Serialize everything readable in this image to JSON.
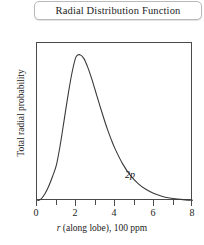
{
  "title": {
    "text": "Radial Distribution Function"
  },
  "annotation": {
    "orbital_label": "2p"
  },
  "axis": {
    "y_title": "Total radial probability",
    "x_title_italic": "r",
    "x_title_rest": " (along lobe), 100 ppm"
  },
  "colors": {
    "frame": "#4a4a4a",
    "curve": "#3a3a3a",
    "title_border": "#b9b9b9",
    "text": "#1b1b1b",
    "background": "#ffffff"
  },
  "chart_data": {
    "type": "line",
    "title": "Radial Distribution Function",
    "xlabel": "r (along lobe), 100 ppm",
    "ylabel": "Total radial probability",
    "xlim": [
      0,
      8
    ],
    "ylim": [
      0,
      1.08
    ],
    "grid": false,
    "legend": null,
    "annotations": [
      {
        "text": "2p",
        "x": 4.5,
        "y": 0.23,
        "style": "italic"
      }
    ],
    "x_ticks_major": [
      0,
      2,
      4,
      6,
      8
    ],
    "x_ticks_minor": [
      1,
      3,
      5,
      7
    ],
    "x_tick_labels": [
      "0",
      "2",
      "4",
      "6",
      "8"
    ],
    "y_ticks": [],
    "y_tick_labels": [],
    "series": [
      {
        "name": "2p",
        "x": [
          0.0,
          0.2,
          0.4,
          0.6,
          0.8,
          1.0,
          1.2,
          1.4,
          1.6,
          1.8,
          2.0,
          2.2,
          2.4,
          2.6,
          2.8,
          3.0,
          3.2,
          3.4,
          3.6,
          3.8,
          4.0,
          4.4,
          4.8,
          5.2,
          5.6,
          6.0,
          6.4,
          6.8,
          7.2,
          7.6,
          8.0
        ],
        "y": [
          0.0,
          0.013,
          0.048,
          0.101,
          0.169,
          0.249,
          0.39,
          0.56,
          0.73,
          0.88,
          0.985,
          1.0,
          0.975,
          0.915,
          0.838,
          0.75,
          0.662,
          0.576,
          0.495,
          0.423,
          0.358,
          0.252,
          0.173,
          0.117,
          0.078,
          0.051,
          0.033,
          0.021,
          0.013,
          0.008,
          0.005
        ]
      }
    ]
  }
}
